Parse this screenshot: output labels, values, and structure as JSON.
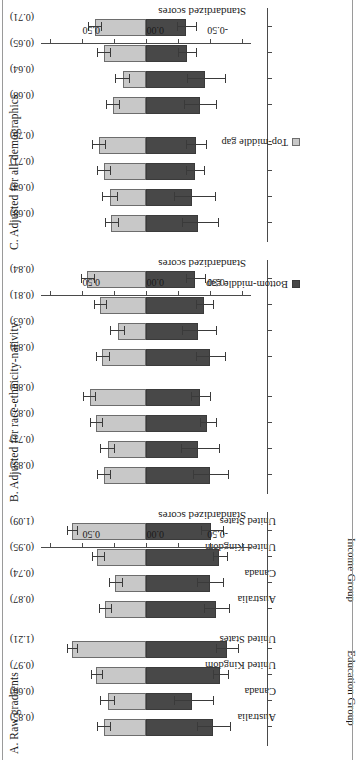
{
  "chart_data": {
    "type": "bar",
    "orientation": "vertical-stacked-with-error-bars",
    "title": "",
    "ylabel": "Standardized scores",
    "xlabel": "",
    "ylim": [
      -0.85,
      0.85
    ],
    "yticks": [
      -0.5,
      0.0,
      0.5
    ],
    "ytick_labels": [
      "-0.50",
      "0.00",
      "0.50"
    ],
    "grid": false,
    "legend_position": "bottom-right",
    "legend": [
      {
        "name": "Bottom-middle gap",
        "color": "#484848"
      },
      {
        "name": "Top-middle gap",
        "color": "#c8c8c8"
      }
    ],
    "categories": [
      "Australia",
      "Canada",
      "United Kingdom",
      "United States"
    ],
    "groups": [
      "Education Group",
      "Income Group"
    ],
    "panels": [
      {
        "id": "A",
        "title": "A. Raw gradients",
        "groups": [
          {
            "name": "Education Group",
            "bars": [
              {
                "category": "Australia",
                "total_label": "(0.85)",
                "total": 0.85,
                "bottom_middle_gap": -0.52,
                "top_middle_gap": 0.33,
                "bottom_err_low": -0.66,
                "bottom_err_high": -0.4,
                "top_err_low": 0.28,
                "top_err_high": 0.38
              },
              {
                "category": "Canada",
                "total_label": "(0.66)",
                "total": 0.66,
                "bottom_middle_gap": -0.36,
                "top_middle_gap": 0.3,
                "bottom_err_low": -0.52,
                "bottom_err_high": -0.22,
                "top_err_low": 0.25,
                "top_err_high": 0.36
              },
              {
                "category": "United Kingdom",
                "total_label": "(0.97)",
                "total": 0.97,
                "bottom_middle_gap": -0.58,
                "top_middle_gap": 0.39,
                "bottom_err_low": -0.64,
                "bottom_err_high": -0.52,
                "top_err_low": 0.34,
                "top_err_high": 0.43
              },
              {
                "category": "United States",
                "total_label": "(1.21)",
                "total": 1.21,
                "bottom_middle_gap": -0.63,
                "top_middle_gap": 0.58,
                "bottom_err_low": -0.72,
                "bottom_err_high": -0.55,
                "top_err_low": 0.54,
                "top_err_high": 0.62
              }
            ]
          },
          {
            "name": "Income Group",
            "bars": [
              {
                "category": "Australia",
                "total_label": "(0.87)",
                "total": 0.87,
                "bottom_middle_gap": -0.55,
                "top_middle_gap": 0.32,
                "bottom_err_low": -0.65,
                "bottom_err_high": -0.45,
                "top_err_low": 0.27,
                "top_err_high": 0.37
              },
              {
                "category": "Canada",
                "total_label": "(0.74)",
                "total": 0.74,
                "bottom_middle_gap": -0.5,
                "top_middle_gap": 0.24,
                "bottom_err_low": -0.6,
                "bottom_err_high": -0.4,
                "top_err_low": 0.19,
                "top_err_high": 0.29
              },
              {
                "category": "United Kingdom",
                "total_label": "(0.95)",
                "total": 0.95,
                "bottom_middle_gap": -0.57,
                "top_middle_gap": 0.38,
                "bottom_err_low": -0.63,
                "bottom_err_high": -0.52,
                "top_err_low": 0.33,
                "top_err_high": 0.42
              },
              {
                "category": "United States",
                "total_label": "(1.09)",
                "total": 1.09,
                "bottom_middle_gap": -0.51,
                "top_middle_gap": 0.58,
                "bottom_err_low": -0.6,
                "bottom_err_high": -0.43,
                "top_err_low": 0.54,
                "top_err_high": 0.62
              }
            ]
          }
        ]
      },
      {
        "id": "B",
        "title": "B. Adjusted for race-ethnicity-nativity",
        "groups": [
          {
            "name": "Education Group",
            "bars": [
              {
                "category": "Australia",
                "total_label": "(0.83)",
                "total": 0.83,
                "bottom_middle_gap": -0.5,
                "top_middle_gap": 0.33,
                "bottom_err_low": -0.64,
                "bottom_err_high": -0.37,
                "top_err_low": 0.28,
                "top_err_high": 0.38
              },
              {
                "category": "Canada",
                "total_label": "(0.71)",
                "total": 0.71,
                "bottom_middle_gap": -0.41,
                "top_middle_gap": 0.3,
                "bottom_err_low": -0.57,
                "bottom_err_high": -0.27,
                "top_err_low": 0.25,
                "top_err_high": 0.36
              },
              {
                "category": "United Kingdom",
                "total_label": "(0.87)",
                "total": 0.87,
                "bottom_middle_gap": -0.48,
                "top_middle_gap": 0.39,
                "bottom_err_low": -0.55,
                "bottom_err_high": -0.42,
                "top_err_low": 0.34,
                "top_err_high": 0.44
              },
              {
                "category": "United States",
                "total_label": "(0.86)",
                "total": 0.86,
                "bottom_middle_gap": -0.42,
                "top_middle_gap": 0.44,
                "bottom_err_low": -0.5,
                "bottom_err_high": -0.35,
                "top_err_low": 0.4,
                "top_err_high": 0.49
              }
            ]
          },
          {
            "name": "Income Group",
            "bars": [
              {
                "category": "Australia",
                "total_label": "(0.84)",
                "total": 0.84,
                "bottom_middle_gap": -0.5,
                "top_middle_gap": 0.34,
                "bottom_err_low": -0.62,
                "bottom_err_high": -0.39,
                "top_err_low": 0.29,
                "top_err_high": 0.39
              },
              {
                "category": "Canada",
                "total_label": "(0.63)",
                "total": 0.63,
                "bottom_middle_gap": -0.41,
                "top_middle_gap": 0.22,
                "bottom_err_low": -0.55,
                "bottom_err_high": -0.28,
                "top_err_low": 0.17,
                "top_err_high": 0.28
              },
              {
                "category": "United Kingdom",
                "total_label": "(0.81)",
                "total": 0.81,
                "bottom_middle_gap": -0.45,
                "top_middle_gap": 0.36,
                "bottom_err_low": -0.52,
                "bottom_err_high": -0.39,
                "top_err_low": 0.31,
                "top_err_high": 0.41
              },
              {
                "category": "United States",
                "total_label": "(0.84)",
                "total": 0.84,
                "bottom_middle_gap": -0.38,
                "top_middle_gap": 0.46,
                "bottom_err_low": -0.46,
                "bottom_err_high": -0.31,
                "top_err_low": 0.41,
                "top_err_high": 0.51
              }
            ]
          }
        ]
      },
      {
        "id": "C",
        "title": "C. Adjusted for all demographics",
        "groups": [
          {
            "name": "Education Group",
            "bars": [
              {
                "category": "Australia",
                "total_label": "(0.68)",
                "total": 0.68,
                "bottom_middle_gap": -0.41,
                "top_middle_gap": 0.27,
                "bottom_err_low": -0.56,
                "bottom_err_high": -0.28,
                "top_err_low": 0.22,
                "top_err_high": 0.32
              },
              {
                "category": "Canada",
                "total_label": "(0.64)",
                "total": 0.64,
                "bottom_middle_gap": -0.36,
                "top_middle_gap": 0.28,
                "bottom_err_low": -0.54,
                "bottom_err_high": -0.22,
                "top_err_low": 0.23,
                "top_err_high": 0.34
              },
              {
                "category": "United Kingdom",
                "total_label": "(0.71)",
                "total": 0.71,
                "bottom_middle_gap": -0.38,
                "top_middle_gap": 0.33,
                "bottom_err_low": -0.45,
                "bottom_err_high": -0.31,
                "top_err_low": 0.28,
                "top_err_high": 0.38
              },
              {
                "category": "United States",
                "total_label": "(0.76)",
                "total": 0.76,
                "bottom_middle_gap": -0.39,
                "top_middle_gap": 0.37,
                "bottom_err_low": -0.47,
                "bottom_err_high": -0.31,
                "top_err_low": 0.32,
                "top_err_high": 0.42
              }
            ]
          },
          {
            "name": "Income Group",
            "bars": [
              {
                "category": "Australia",
                "total_label": "(0.68)",
                "total": 0.68,
                "bottom_middle_gap": -0.42,
                "top_middle_gap": 0.26,
                "bottom_err_low": -0.55,
                "bottom_err_high": -0.3,
                "top_err_low": 0.21,
                "top_err_high": 0.31
              },
              {
                "category": "Canada",
                "total_label": "(0.64)",
                "total": 0.64,
                "bottom_middle_gap": -0.46,
                "top_middle_gap": 0.18,
                "bottom_err_low": -0.62,
                "bottom_err_high": -0.32,
                "top_err_low": 0.13,
                "top_err_high": 0.24
              },
              {
                "category": "United Kingdom",
                "total_label": "(0.65)",
                "total": 0.65,
                "bottom_middle_gap": -0.32,
                "top_middle_gap": 0.33,
                "bottom_err_low": -0.39,
                "bottom_err_high": -0.25,
                "top_err_low": 0.28,
                "top_err_high": 0.38
              },
              {
                "category": "United States",
                "total_label": "(0.71)",
                "total": 0.71,
                "bottom_middle_gap": -0.31,
                "top_middle_gap": 0.4,
                "bottom_err_low": -0.39,
                "bottom_err_high": -0.24,
                "top_err_low": 0.35,
                "top_err_high": 0.45
              }
            ]
          }
        ]
      }
    ]
  }
}
